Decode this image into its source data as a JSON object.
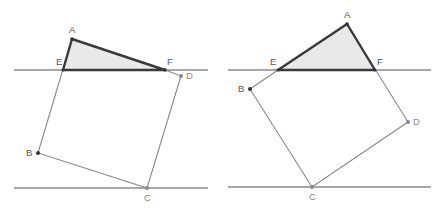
{
  "figures": [
    {
      "id": "left",
      "lines": [
        {
          "x1": 14,
          "y1": 70,
          "x2": 208,
          "y2": 70
        },
        {
          "x1": 14,
          "y1": 188,
          "x2": 208,
          "y2": 188
        }
      ],
      "points": {
        "A": {
          "x": 72,
          "y": 39,
          "label": "A",
          "lx": 69,
          "ly": 33
        },
        "E": {
          "x": 63,
          "y": 70,
          "label": "E",
          "lx": 56,
          "ly": 65
        },
        "F": {
          "x": 165,
          "y": 70,
          "label": "F",
          "lx": 167,
          "ly": 65
        },
        "D": {
          "x": 181,
          "y": 76,
          "label": "D",
          "lx": 186,
          "ly": 79
        },
        "B": {
          "x": 38,
          "y": 153,
          "label": "B",
          "lx": 26,
          "ly": 156
        },
        "C": {
          "x": 147,
          "y": 188,
          "label": "C",
          "lx": 144,
          "ly": 201
        }
      },
      "triangle": "A-E-F",
      "square": "B-C-D-(E side)"
    },
    {
      "id": "right",
      "lines": [
        {
          "x1": 228,
          "y1": 70,
          "x2": 431,
          "y2": 70
        },
        {
          "x1": 228,
          "y1": 187,
          "x2": 431,
          "y2": 187
        }
      ],
      "points": {
        "A": {
          "x": 347,
          "y": 24,
          "label": "A",
          "lx": 344,
          "ly": 18
        },
        "E": {
          "x": 278,
          "y": 70,
          "label": "E",
          "lx": 270,
          "ly": 65
        },
        "F": {
          "x": 375,
          "y": 70,
          "label": "F",
          "lx": 377,
          "ly": 65
        },
        "B": {
          "x": 250,
          "y": 89,
          "label": "B",
          "lx": 238,
          "ly": 92
        },
        "D": {
          "x": 408,
          "y": 122,
          "label": "D",
          "lx": 413,
          "ly": 125
        },
        "C": {
          "x": 312,
          "y": 187,
          "label": "C",
          "lx": 309,
          "ly": 200
        }
      },
      "triangle": "A-E-F",
      "square": "B-C-D-(F side)"
    }
  ],
  "colors": {
    "triangle_fill": "#e8eaea",
    "triangle_stroke": "#3a3a3a",
    "line_stroke": "#8a8a8a",
    "label": "#555555"
  }
}
